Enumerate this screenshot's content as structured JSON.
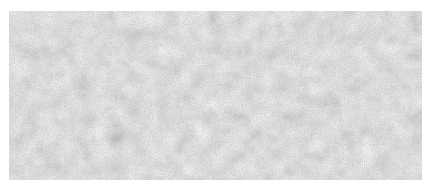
{
  "image": {
    "description": "Gray mottled texture swatch",
    "colors": {
      "base": "#a9a9a9",
      "dark": "#8c8c8c",
      "light": "#c4c4c4",
      "background": "#ffffff"
    }
  }
}
